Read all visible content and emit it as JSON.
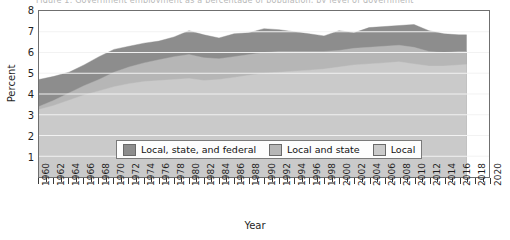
{
  "figure": {
    "clipped_header": "Figure 1. Government employment as a percentage of population, by level of government",
    "background": "#ffffff"
  },
  "axes": {
    "y": {
      "label": "Percent",
      "ticks": [
        "8",
        "7",
        "6",
        "5",
        "4",
        "3",
        "2",
        "1"
      ],
      "min": 0,
      "max": 8
    },
    "x": {
      "label": "Year",
      "ticks": [
        "1960",
        "1962",
        "1964",
        "1966",
        "1968",
        "1970",
        "1972",
        "1974",
        "1976",
        "1978",
        "1980",
        "1982",
        "1984",
        "1986",
        "1988",
        "1990",
        "1992",
        "1994",
        "1996",
        "1998",
        "2000",
        "2002",
        "2004",
        "2006",
        "2008",
        "2010",
        "2012",
        "2014",
        "2016",
        "2018",
        "2020"
      ],
      "min": 1960,
      "max": 2020
    }
  },
  "legend": {
    "items": [
      {
        "label": "Local, state, and federal",
        "color": "#8d8d8d"
      },
      {
        "label": "Local and state",
        "color": "#b6b6b6"
      },
      {
        "label": "Local",
        "color": "#cacaca"
      }
    ]
  },
  "colors": {
    "federal_band": "#8d8d8d",
    "state_band": "#b6b6b6",
    "local_band": "#cacaca",
    "gridline": "#f2f2f2",
    "frame": "#6f6f6f"
  },
  "chart_data": {
    "type": "area",
    "title": "Government employment as a percentage of population, by level of government",
    "xlabel": "Year",
    "ylabel": "Percent",
    "xlim": [
      1960,
      2020
    ],
    "ylim": [
      0,
      8
    ],
    "grid": true,
    "legend_position": "inside-bottom-center",
    "stacked": true,
    "note": "Bands are cumulative totals: 'Local' is the bottom band, 'Local and state' is the cumulative local+state line, 'Local, state, and federal' is the cumulative total line.",
    "x": [
      1960,
      1962,
      1964,
      1966,
      1968,
      1970,
      1972,
      1974,
      1976,
      1978,
      1980,
      1982,
      1984,
      1986,
      1988,
      1990,
      1992,
      1994,
      1996,
      1998,
      2000,
      2002,
      2004,
      2006,
      2008,
      2010,
      2012,
      2014,
      2016,
      2017
    ],
    "series": [
      {
        "name": "Local",
        "values": [
          3.25,
          3.45,
          3.7,
          3.95,
          4.15,
          4.35,
          4.5,
          4.6,
          4.65,
          4.7,
          4.75,
          4.65,
          4.7,
          4.8,
          4.9,
          5.0,
          5.05,
          5.1,
          5.15,
          5.2,
          5.3,
          5.4,
          5.45,
          5.5,
          5.55,
          5.45,
          5.35,
          5.35,
          5.4,
          5.42
        ]
      },
      {
        "name": "Local and state",
        "values": [
          3.4,
          3.7,
          4.05,
          4.4,
          4.7,
          5.05,
          5.3,
          5.5,
          5.65,
          5.8,
          5.9,
          5.75,
          5.7,
          5.8,
          5.9,
          6.0,
          6.05,
          6.05,
          6.05,
          6.05,
          6.1,
          6.2,
          6.25,
          6.3,
          6.35,
          6.25,
          6.05,
          6.0,
          6.05,
          6.05
        ]
      },
      {
        "name": "Local, state, and federal",
        "values": [
          4.7,
          4.85,
          5.05,
          5.4,
          5.8,
          6.15,
          6.3,
          6.45,
          6.55,
          6.75,
          7.05,
          6.85,
          6.7,
          6.9,
          6.95,
          7.15,
          7.1,
          7.0,
          6.9,
          6.8,
          7.05,
          6.95,
          7.2,
          7.25,
          7.3,
          7.35,
          7.05,
          6.9,
          6.85,
          6.85
        ]
      }
    ]
  }
}
